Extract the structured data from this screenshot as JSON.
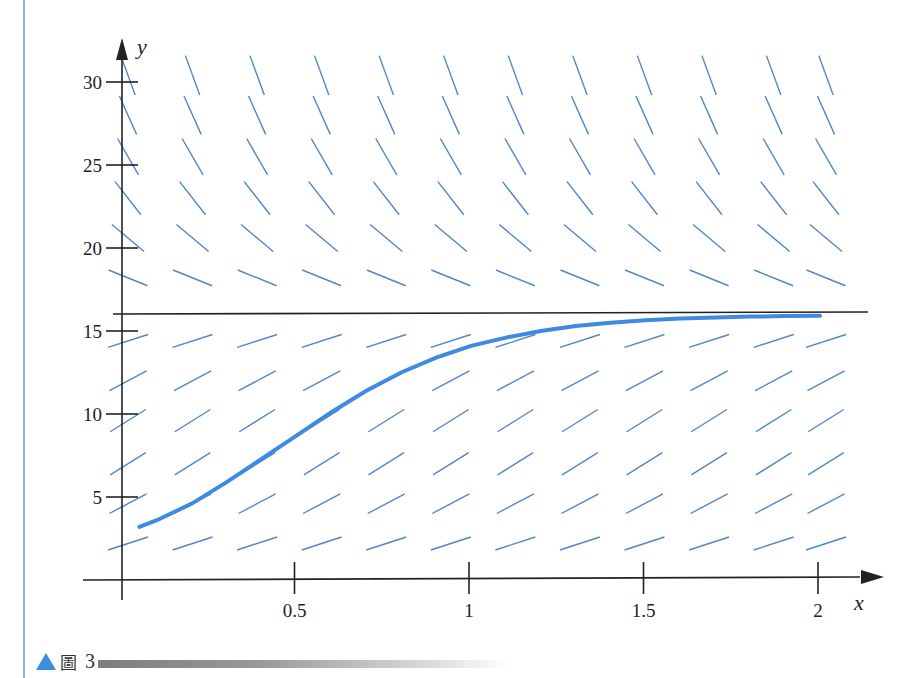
{
  "chart_data": {
    "type": "line",
    "subtype": "slope-field",
    "title": "",
    "xlabel": "x",
    "ylabel": "y",
    "xlim": [
      0,
      2.1
    ],
    "ylim": [
      0,
      31
    ],
    "x_ticks": [
      0.5,
      1,
      1.5,
      2
    ],
    "x_tick_labels": [
      "0.5",
      "1",
      "1.5",
      "2"
    ],
    "y_ticks": [
      5,
      10,
      15,
      20,
      25,
      30
    ],
    "y_tick_labels": [
      "5",
      "10",
      "15",
      "20",
      "25",
      "30"
    ],
    "grid": false,
    "legend": null,
    "equilibrium_line": {
      "y": 16,
      "color": "#222222"
    },
    "slope_field": {
      "color": "#4f86cc",
      "columns_x": [
        0,
        0.185,
        0.37,
        0.555,
        0.74,
        0.925,
        1.11,
        1.295,
        1.48,
        1.665,
        1.85,
        2.0
      ],
      "rows": [
        {
          "y": 2.2,
          "angle_deg": 18
        },
        {
          "y": 4.6,
          "angle_deg": 28
        },
        {
          "y": 7.0,
          "angle_deg": 32
        },
        {
          "y": 9.6,
          "angle_deg": 32
        },
        {
          "y": 12.0,
          "angle_deg": 28
        },
        {
          "y": 14.4,
          "angle_deg": 18
        },
        {
          "y": 18.2,
          "angle_deg": -22
        },
        {
          "y": 20.6,
          "angle_deg": -40
        },
        {
          "y": 23.0,
          "angle_deg": -52
        },
        {
          "y": 25.5,
          "angle_deg": -60
        },
        {
          "y": 28.0,
          "angle_deg": -66
        },
        {
          "y": 30.4,
          "angle_deg": -70
        }
      ]
    },
    "series": [
      {
        "name": "solution curve",
        "color": "#3d8ae0",
        "x": [
          0.05,
          0.1,
          0.2,
          0.3,
          0.4,
          0.5,
          0.6,
          0.7,
          0.8,
          0.9,
          1.0,
          1.1,
          1.2,
          1.3,
          1.4,
          1.5,
          1.6,
          1.7,
          1.8,
          1.9,
          2.0
        ],
        "y": [
          3.2,
          3.6,
          4.6,
          5.9,
          7.3,
          8.7,
          10.1,
          11.4,
          12.5,
          13.4,
          14.1,
          14.6,
          15.0,
          15.3,
          15.5,
          15.65,
          15.75,
          15.82,
          15.87,
          15.9,
          15.92
        ]
      }
    ]
  },
  "axes": {
    "x_label": "x",
    "y_label": "y",
    "x_tick_labels": [
      "0.5",
      "1",
      "1.5",
      "2"
    ],
    "y_tick_labels": [
      "30",
      "25",
      "20",
      "15",
      "10",
      "5"
    ]
  },
  "caption": {
    "figure_glyph": "圖",
    "number": "3",
    "triangle_color": "#3d8fe0"
  }
}
